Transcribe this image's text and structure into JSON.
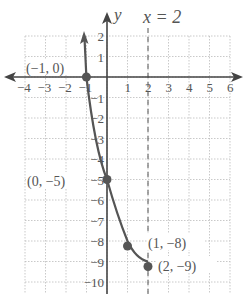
{
  "chart_data": {
    "type": "line",
    "title": "",
    "xlabel": "",
    "ylabel": "y",
    "xlim": [
      -4,
      6
    ],
    "ylim": [
      -10,
      2
    ],
    "grid": true,
    "x_ticks": [
      "-4",
      "-3",
      "-2",
      "-1",
      "1",
      "2",
      "3",
      "4",
      "5",
      "6"
    ],
    "y_ticks": [
      "2",
      "1",
      "-1",
      "-2",
      "-3",
      "-4",
      "-5",
      "-6",
      "-7",
      "-8",
      "-9",
      "-10"
    ],
    "series": [
      {
        "name": "curve",
        "x": [
          -1.2,
          -1,
          0,
          1,
          2
        ],
        "y": [
          2,
          0,
          -5,
          -8,
          -9
        ],
        "color": "#555555"
      }
    ],
    "points": [
      {
        "x": -1,
        "y": 0,
        "label": "(−1, 0)"
      },
      {
        "x": 0,
        "y": -5,
        "label": "(0, −5)"
      },
      {
        "x": 1,
        "y": -8,
        "label": "(1, −8)"
      },
      {
        "x": 2,
        "y": -9,
        "label": "(2, −9)"
      }
    ],
    "annotations": [
      {
        "type": "vertical-dashed-line",
        "x": 2,
        "label": "x = 2"
      }
    ]
  },
  "labels": {
    "asymptote": "x = 2",
    "y_axis": "y",
    "p1": "(−1, 0)",
    "p2": "(0, −5)",
    "p3": "(1, −8)",
    "p4": "(2, −9)"
  }
}
